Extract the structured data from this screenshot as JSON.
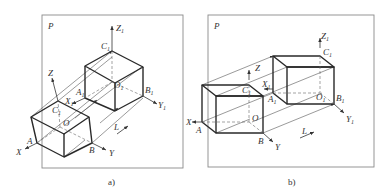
{
  "figure": {
    "panels": [
      {
        "id": "a",
        "caption": "a)",
        "plane_label": "P",
        "direction_label": "L",
        "points": {
          "A": "A",
          "B": "B",
          "C": "C",
          "O": "O",
          "A1": "A",
          "B1": "B",
          "C1": "C",
          "O1": "O"
        },
        "axes": {
          "X": "X",
          "Y": "Y",
          "Z": "Z",
          "X1": "X",
          "Y1": "Y",
          "Z1": "Z"
        },
        "subscript": "1"
      },
      {
        "id": "b",
        "caption": "b)",
        "plane_label": "P",
        "direction_label": "L",
        "points": {
          "A": "A",
          "B": "B",
          "C": "C",
          "O": "O",
          "A1": "A",
          "B1": "B",
          "C1": "C",
          "O1": "O"
        },
        "axes": {
          "X": "X",
          "Y": "Y",
          "Z": "Z",
          "X1": "X",
          "Y1": "Y",
          "Z1": "Z"
        },
        "subscript": "1"
      }
    ],
    "colors": {
      "line": "#2a2a2a",
      "frame": "#8a8a8a",
      "background": "#ffffff"
    }
  }
}
